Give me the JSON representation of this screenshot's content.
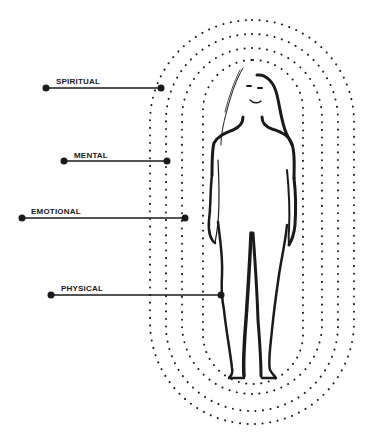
{
  "diagram": {
    "type": "layered-aura-diagram",
    "colors": {
      "ink": "#1a1a1a",
      "background": "#ffffff"
    },
    "layers": [
      {
        "label": "SPIRITUAL",
        "label_x": 56,
        "label_y": 77,
        "line_x1": 46,
        "line_x2": 161,
        "line_y": 88
      },
      {
        "label": "MENTAL",
        "label_x": 74,
        "label_y": 151,
        "line_x1": 64,
        "line_x2": 167,
        "line_y": 161
      },
      {
        "label": "EMOTIONAL",
        "label_x": 31,
        "label_y": 207,
        "line_x1": 22,
        "line_x2": 185,
        "line_y": 218
      },
      {
        "label": "PHYSICAL",
        "label_x": 61,
        "label_y": 284,
        "line_x1": 51,
        "line_x2": 221,
        "line_y": 295
      }
    ],
    "rings": [
      {
        "name": "outer",
        "x": 150,
        "y": 20,
        "w": 204,
        "h": 404,
        "rx": 102
      },
      {
        "name": "second",
        "x": 166,
        "y": 34,
        "w": 172,
        "h": 377,
        "rx": 86
      },
      {
        "name": "third",
        "x": 182,
        "y": 48,
        "w": 140,
        "h": 346,
        "rx": 70
      },
      {
        "name": "inner",
        "x": 203,
        "y": 60,
        "w": 100,
        "h": 324,
        "rx": 50
      }
    ]
  }
}
